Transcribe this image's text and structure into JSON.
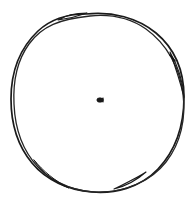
{
  "canvas": {
    "width": 194,
    "height": 208,
    "background_color": "#ffffff",
    "title": "Hand-drawn circle sketch"
  },
  "drawing": {
    "subject": "circle",
    "style": "hand-drawn double-traced freehand outline",
    "ink_color": "#1a1a1a",
    "ink_color_secondary": "#2b2b2b",
    "stroke_width": 1.6,
    "stroke_width_secondary": 1.2,
    "bounds": {
      "left": 10,
      "top": 12,
      "right": 185,
      "bottom": 193
    },
    "center": {
      "x": 100,
      "y": 100
    },
    "radius_x": 87,
    "radius_y": 90,
    "passes": 2,
    "strokes": [
      {
        "name": "outer-loop-pass-1",
        "color": "#1a1a1a",
        "width": 1.7,
        "path": "M 86 14 C 112 11 138 18 156 33 C 174 48 184 70 184 97 C 184 124 176 150 158 169 C 140 188 114 194 92 192 C 68 190 46 180 32 163 C 17 145 11 122 11 99 C 11 74 19 49 38 31 C 52 18 68 14 86 14 Z"
      },
      {
        "name": "outer-loop-pass-2",
        "color": "#262626",
        "width": 1.3,
        "path": "M 90 16 C 60 19 42 26 29 44 C 16 62 13 84 14 104 C 15 128 22 150 38 167 C 55 185 80 193 103 192 C 127 191 151 181 166 162 C 181 143 186 118 183 94 C 180 68 167 44 146 29 C 130 18 110 14 90 16 Z"
      },
      {
        "name": "overlap-lens-top-left",
        "color": "#1a1a1a",
        "width": 1.1,
        "path": "M 58 20 C 66 15 76 13 87 13 C 76 17 66 19 58 20 Z"
      },
      {
        "name": "overlap-lens-right",
        "color": "#1a1a1a",
        "width": 1.1,
        "path": "M 170 52 C 178 66 183 82 184 97 C 180 81 175 66 170 52 Z"
      },
      {
        "name": "overlap-lens-bottom-right",
        "color": "#1a1a1a",
        "width": 1.1,
        "path": "M 146 172 C 137 180 126 186 114 189 C 126 183 137 178 146 172 Z"
      },
      {
        "name": "overlap-lens-bottom-left",
        "color": "#1a1a1a",
        "width": 1.0,
        "path": "M 34 160 C 43 173 55 183 69 188 C 55 181 43 171 34 160 Z"
      },
      {
        "name": "kink-notch-right",
        "color": "#111111",
        "width": 1.6,
        "path": "M 170 55 L 175 61"
      }
    ],
    "center_mark": {
      "name": "center-dot",
      "color": "#1a1a1a",
      "x": 100,
      "y": 100,
      "width": 7,
      "height": 5,
      "description": "small dark arrowhead-like blob at the circle center"
    }
  }
}
